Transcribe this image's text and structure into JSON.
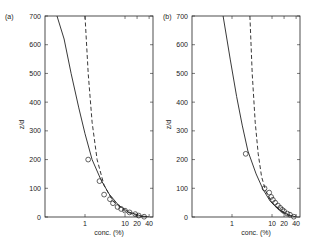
{
  "chart_data": [
    {
      "type": "line",
      "panel_label": "(a)",
      "xlabel": "conc. (%)",
      "ylabel": "z/d",
      "xscale": "log",
      "xlim": [
        0.1,
        50
      ],
      "ylim": [
        0,
        700
      ],
      "xticks": [
        "1",
        "10",
        "20",
        "40"
      ],
      "yticks": [
        "0",
        "100",
        "200",
        "300",
        "400",
        "500",
        "600",
        "700"
      ],
      "series": [
        {
          "name": "model (solid)",
          "style": "solid",
          "points": [
            [
              0.2,
              700
            ],
            [
              0.3,
              620
            ],
            [
              0.45,
              500
            ],
            [
              0.7,
              380
            ],
            [
              1.0,
              290
            ],
            [
              1.5,
              200
            ],
            [
              2.5,
              130
            ],
            [
              4,
              80
            ],
            [
              7,
              40
            ],
            [
              12,
              18
            ],
            [
              25,
              4
            ],
            [
              40,
              0
            ]
          ]
        },
        {
          "name": "model (dashed)",
          "style": "dashed",
          "points": [
            [
              1.0,
              700
            ],
            [
              1.2,
              500
            ],
            [
              1.5,
              330
            ],
            [
              2.0,
              200
            ],
            [
              3.0,
              110
            ],
            [
              5,
              55
            ],
            [
              10,
              20
            ],
            [
              20,
              5
            ],
            [
              30,
              0
            ]
          ]
        },
        {
          "name": "observations",
          "style": "markers",
          "points": [
            [
              1.2,
              200
            ],
            [
              2.3,
              125
            ],
            [
              3.0,
              78
            ],
            [
              4.2,
              62
            ],
            [
              5.0,
              48
            ],
            [
              6.5,
              35
            ],
            [
              8,
              28
            ],
            [
              10,
              22
            ],
            [
              13,
              16
            ],
            [
              18,
              10
            ],
            [
              22,
              5
            ],
            [
              30,
              1
            ]
          ]
        }
      ]
    },
    {
      "type": "line",
      "panel_label": "(b)",
      "xlabel": "conc. (%)",
      "ylabel": "z/d",
      "xscale": "log",
      "xlim": [
        0.1,
        50
      ],
      "ylim": [
        0,
        700
      ],
      "xticks": [
        "1",
        "10",
        "20",
        "40"
      ],
      "yticks": [
        "0",
        "100",
        "200",
        "300",
        "400",
        "500",
        "600",
        "700"
      ],
      "series": [
        {
          "name": "model (solid)",
          "style": "solid",
          "points": [
            [
              0.6,
              700
            ],
            [
              0.9,
              550
            ],
            [
              1.3,
              420
            ],
            [
              1.8,
              320
            ],
            [
              2.5,
              230
            ],
            [
              4,
              150
            ],
            [
              6,
              95
            ],
            [
              9,
              55
            ],
            [
              14,
              28
            ],
            [
              25,
              8
            ],
            [
              40,
              0
            ]
          ]
        },
        {
          "name": "model (dashed)",
          "style": "dashed",
          "points": [
            [
              2.8,
              700
            ],
            [
              3.2,
              500
            ],
            [
              3.8,
              330
            ],
            [
              4.5,
              220
            ],
            [
              5.5,
              140
            ],
            [
              7,
              90
            ],
            [
              10,
              50
            ],
            [
              18,
              18
            ],
            [
              30,
              2
            ]
          ]
        },
        {
          "name": "observations",
          "style": "markers",
          "points": [
            [
              2.2,
              220
            ],
            [
              6.5,
              100
            ],
            [
              8.5,
              85
            ],
            [
              9.5,
              70
            ],
            [
              10.5,
              60
            ],
            [
              12,
              50
            ],
            [
              14,
              40
            ],
            [
              16,
              32
            ],
            [
              18,
              25
            ],
            [
              20,
              20
            ],
            [
              24,
              12
            ],
            [
              28,
              8
            ],
            [
              35,
              1
            ]
          ]
        }
      ]
    }
  ]
}
